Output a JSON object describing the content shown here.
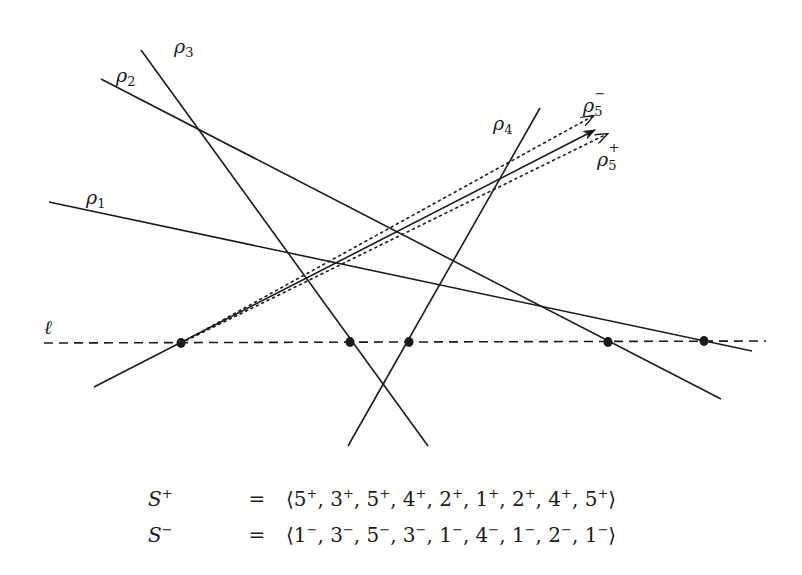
{
  "figure": {
    "baseline_label": "ℓ",
    "lines": [
      {
        "id": "rho1",
        "label": "ρ",
        "sub": "1",
        "sup": "",
        "x1": 49,
        "y1": 202,
        "x2": 752,
        "y2": 351
      },
      {
        "id": "rho2",
        "label": "ρ",
        "sub": "2",
        "sup": "",
        "x1": 101,
        "y1": 79,
        "x2": 721,
        "y2": 399
      },
      {
        "id": "rho3",
        "label": "ρ",
        "sub": "3",
        "sup": "",
        "x1": 141,
        "y1": 50,
        "x2": 428,
        "y2": 446
      },
      {
        "id": "rho4",
        "label": "ρ",
        "sub": "4",
        "sup": "",
        "x1": 540,
        "y1": 108,
        "x2": 348,
        "y2": 446
      },
      {
        "id": "rho5",
        "label": "ρ",
        "sub": "5",
        "sup": "",
        "x1": 94,
        "y1": 387,
        "x2": 595,
        "y2": 130
      }
    ],
    "perturbed": [
      {
        "id": "rho5-minus",
        "label": "ρ",
        "sub": "5",
        "sup": "−"
      },
      {
        "id": "rho5-plus",
        "label": "ρ",
        "sub": "5",
        "sup": "+"
      }
    ],
    "baseline": {
      "x1": 44,
      "y1": 343,
      "x2": 766,
      "y2": 341
    },
    "intersection_points": [
      {
        "x": 181,
        "y": 343
      },
      {
        "x": 350,
        "y": 342
      },
      {
        "x": 409,
        "y": 342
      },
      {
        "x": 608,
        "y": 342
      },
      {
        "x": 704,
        "y": 341
      }
    ]
  },
  "equations": [
    {
      "lhs": "S",
      "lhs_sup": "+",
      "op": "=",
      "sequence": [
        "5",
        "3",
        "5",
        "4",
        "2",
        "1",
        "2",
        "4",
        "5"
      ],
      "sign": "+"
    },
    {
      "lhs": "S",
      "lhs_sup": "−",
      "op": "=",
      "sequence": [
        "1",
        "3",
        "5",
        "3",
        "1",
        "4",
        "1",
        "2",
        "1"
      ],
      "sign": "−"
    }
  ]
}
